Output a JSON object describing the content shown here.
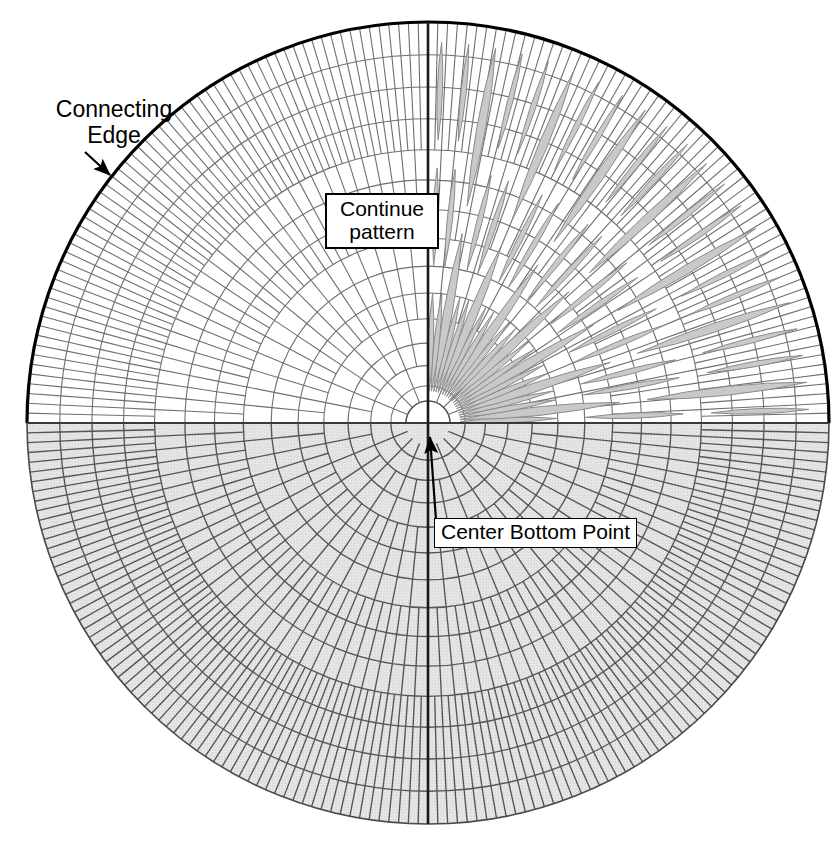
{
  "figure": {
    "type": "technical-diagram",
    "canvas": {
      "width": 833,
      "height": 853
    },
    "circle": {
      "center_x": 428,
      "center_y": 423,
      "radius": 401
    },
    "colors": {
      "outline": "#000000",
      "grid_top": "#6b6b6b",
      "grid_bottom": "#555555",
      "bottom_fill": "#e3e3e3",
      "petal_fill": "#c9c9c9",
      "petal_stroke": "#8c8c8c",
      "background": "#ffffff"
    }
  },
  "labels": {
    "connecting_edge": "Connecting\nEdge",
    "continue_pattern": "Continue\npattern",
    "center_bottom_point": "Center Bottom Point"
  },
  "mesh": {
    "rings": 14,
    "inner_radius_fraction": 0.055,
    "radial_base_sectors": 8,
    "radial_subdivision_levels": [
      1,
      1,
      2,
      2,
      4,
      4,
      4,
      8,
      8,
      8,
      16,
      16,
      16,
      16
    ],
    "half_top_filled": false,
    "half_bottom_filled": true
  },
  "petals": {
    "count": 22,
    "quadrant": "upper-right",
    "angle_start_deg": 0,
    "angle_end_deg": 90,
    "shape": "lens",
    "segments_per_ray": [
      1,
      2,
      3
    ],
    "fill": "#c9c9c9",
    "stroke": "#8c8c8c"
  },
  "annotations": [
    {
      "name": "connecting-edge",
      "text": "Connecting\nEdge",
      "arrow_from": [
        85,
        152
      ],
      "arrow_to": [
        110,
        175
      ]
    },
    {
      "name": "continue-pattern",
      "text": "Continue\npattern",
      "boxed": true
    },
    {
      "name": "center-bottom-point",
      "text": "Center Bottom Point",
      "boxed": true,
      "arrow_from": [
        436,
        520
      ],
      "arrow_to": [
        430,
        437
      ]
    }
  ]
}
